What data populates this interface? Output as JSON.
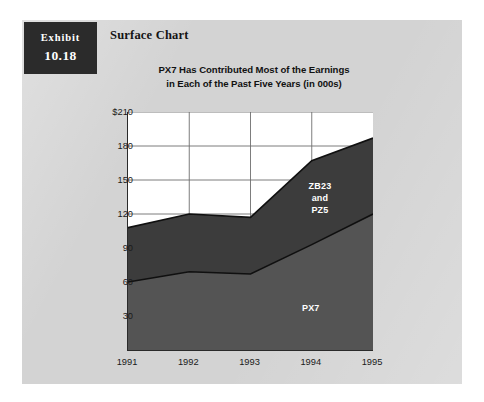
{
  "exhibit": {
    "word": "Exhibit",
    "number": "10.18"
  },
  "card": {
    "heading": "Surface Chart"
  },
  "colors": {
    "page_background": "#ffffff",
    "card_background": "#d3d3d3",
    "exhibit_tab": "#2b2b2b",
    "plot_background": "#ffffff",
    "axis": "#2a2a2a",
    "gridline": "#6e6e6e",
    "series_upper_fill": "#3c3c3c",
    "series_lower_fill": "#545454",
    "series_outline": "#101010",
    "label_text": "#ffffff"
  },
  "chart_data": {
    "type": "area",
    "title": "PX7 Has Contributed Most of the Earnings in Each of the Past Five Years (in 000s)",
    "title_line1": "PX7 Has Contributed Most of the Earnings",
    "title_line2": "in Each of the Past Five Years (in 000s)",
    "xlabel": "",
    "ylabel": "",
    "stacked": true,
    "grid": true,
    "legend_position": "inside-plot-labels",
    "categories": [
      "1991",
      "1992",
      "1993",
      "1994",
      "1995"
    ],
    "x": [
      1991,
      1992,
      1993,
      1994,
      1995
    ],
    "ylim": [
      0,
      210
    ],
    "yticks": [
      30,
      60,
      90,
      120,
      150,
      180,
      210
    ],
    "ytick_labels": [
      "30",
      "60",
      "90",
      "120",
      "150",
      "180",
      "$210"
    ],
    "series": [
      {
        "name": "PX7",
        "label": "PX7",
        "color": "#545454",
        "values": [
          60,
          69,
          67,
          93,
          120
        ]
      },
      {
        "name": "ZB23 and PZ5",
        "label_line1": "ZB23",
        "label_line2": "and",
        "label_line3": "PZ5",
        "color": "#3c3c3c",
        "values": [
          48,
          51,
          50,
          74,
          67
        ]
      }
    ],
    "cumulative_top": [
      108,
      120,
      117,
      167,
      187
    ],
    "annotations": [
      {
        "text": "ZB23 and PZ5",
        "series": "ZB23 and PZ5"
      },
      {
        "text": "PX7",
        "series": "PX7"
      }
    ]
  }
}
